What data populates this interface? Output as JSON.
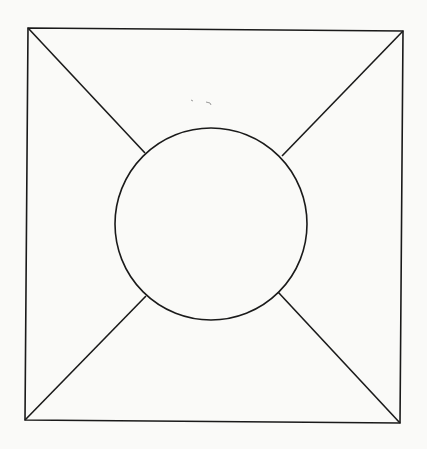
{
  "figure": {
    "stroke_color": "#1a1a1a",
    "background_color": "#fafaf8",
    "square": {
      "corners": {
        "top_left": [
          28,
          28
        ],
        "top_right": [
          403,
          31
        ],
        "bottom_right": [
          400,
          423
        ],
        "bottom_left": [
          25,
          420
        ]
      }
    },
    "circle": {
      "cx": 211,
      "cy": 224,
      "r": 96
    },
    "segments": [
      {
        "name": "top-left",
        "from": [
          28,
          28
        ],
        "to": [
          145,
          153
        ]
      },
      {
        "name": "top-right",
        "from": [
          403,
          31
        ],
        "to": [
          282,
          156
        ]
      },
      {
        "name": "bottom-right",
        "from": [
          400,
          423
        ],
        "to": [
          278,
          292
        ]
      },
      {
        "name": "bottom-left",
        "from": [
          25,
          420
        ],
        "to": [
          146,
          296
        ]
      }
    ]
  }
}
